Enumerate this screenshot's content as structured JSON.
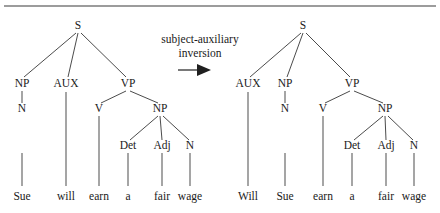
{
  "figure": {
    "background_color": "#ffffff",
    "ink_color": "#1a1a1a",
    "top_rule": {
      "x1": 4,
      "y1": 6,
      "x2": 436,
      "y2": 6
    }
  },
  "operation": {
    "line1": "subject-auxiliary",
    "line2": "inversion",
    "line1_pos": {
      "x": 200,
      "y": 43
    },
    "line2_pos": {
      "x": 200,
      "y": 57
    },
    "arrow": {
      "tail_x1": 178,
      "tail_x2": 197,
      "y": 70,
      "head_points": "197,64 211,70 197,76"
    }
  },
  "trees": [
    {
      "id": "tree-source",
      "name": "source-tree",
      "sentence": "Sue will earn a fair wage",
      "nodes": [
        {
          "id": "S",
          "label": "S",
          "x": 78,
          "y": 29
        },
        {
          "id": "NP1",
          "label": "NP",
          "x": 22,
          "y": 87
        },
        {
          "id": "AUX",
          "label": "AUX",
          "x": 66,
          "y": 87
        },
        {
          "id": "VP",
          "label": "VP",
          "x": 128,
          "y": 87
        },
        {
          "id": "N1",
          "label": "N",
          "x": 22,
          "y": 112
        },
        {
          "id": "V",
          "label": "V",
          "x": 99,
          "y": 112
        },
        {
          "id": "NP2",
          "label": "NP",
          "x": 160,
          "y": 112
        },
        {
          "id": "Det",
          "label": "Det",
          "x": 128,
          "y": 149
        },
        {
          "id": "Adj",
          "label": "Adj",
          "x": 162,
          "y": 149
        },
        {
          "id": "N2",
          "label": "N",
          "x": 190,
          "y": 149
        }
      ],
      "edges": [
        {
          "from": "S",
          "to": "NP1",
          "x1": 76,
          "y1": 33,
          "x2": 24,
          "y2": 77
        },
        {
          "from": "S",
          "to": "AUX",
          "x1": 78,
          "y1": 33,
          "x2": 68,
          "y2": 77
        },
        {
          "from": "S",
          "to": "VP",
          "x1": 81,
          "y1": 33,
          "x2": 126,
          "y2": 77
        },
        {
          "from": "NP1",
          "to": "N1",
          "x1": 22,
          "y1": 91,
          "x2": 22,
          "y2": 103
        },
        {
          "from": "VP",
          "to": "V",
          "x1": 126,
          "y1": 91,
          "x2": 101,
          "y2": 103
        },
        {
          "from": "VP",
          "to": "NP2",
          "x1": 130,
          "y1": 91,
          "x2": 158,
          "y2": 103
        },
        {
          "from": "NP2",
          "to": "Det",
          "x1": 158,
          "y1": 116,
          "x2": 130,
          "y2": 140
        },
        {
          "from": "NP2",
          "to": "Adj",
          "x1": 160,
          "y1": 116,
          "x2": 162,
          "y2": 140
        },
        {
          "from": "NP2",
          "to": "N2",
          "x1": 163,
          "y1": 116,
          "x2": 189,
          "y2": 140
        }
      ],
      "leaves": [
        {
          "label": "Sue",
          "x": 22,
          "y": 200,
          "stem_from": "N1",
          "stem_y1": 153,
          "stem_y2": 186
        },
        {
          "label": "will",
          "x": 66,
          "y": 200,
          "stem_from": "AUX",
          "stem_y1": 92,
          "stem_y2": 186
        },
        {
          "label": "earn",
          "x": 99,
          "y": 200,
          "stem_from": "V",
          "stem_y1": 116,
          "stem_y2": 186
        },
        {
          "label": "a",
          "x": 128,
          "y": 200,
          "stem_from": "Det",
          "stem_y1": 153,
          "stem_y2": 186
        },
        {
          "label": "fair",
          "x": 162,
          "y": 200,
          "stem_from": "Adj",
          "stem_y1": 153,
          "stem_y2": 186
        },
        {
          "label": "wage",
          "x": 190,
          "y": 200,
          "stem_from": "N2",
          "stem_y1": 153,
          "stem_y2": 186
        }
      ]
    },
    {
      "id": "tree-result",
      "name": "result-tree",
      "sentence": "Will Sue earn a fair wage",
      "nodes": [
        {
          "id": "S",
          "label": "S",
          "x": 303,
          "y": 29
        },
        {
          "id": "AUX",
          "label": "AUX",
          "x": 248,
          "y": 87
        },
        {
          "id": "NP1",
          "label": "NP",
          "x": 285,
          "y": 87
        },
        {
          "id": "VP",
          "label": "VP",
          "x": 352,
          "y": 87
        },
        {
          "id": "N1",
          "label": "N",
          "x": 285,
          "y": 112
        },
        {
          "id": "V",
          "label": "V",
          "x": 323,
          "y": 112
        },
        {
          "id": "NP2",
          "label": "NP",
          "x": 385,
          "y": 112
        },
        {
          "id": "Det",
          "label": "Det",
          "x": 352,
          "y": 149
        },
        {
          "id": "Adj",
          "label": "Adj",
          "x": 386,
          "y": 149
        },
        {
          "id": "N2",
          "label": "N",
          "x": 414,
          "y": 149
        }
      ],
      "edges": [
        {
          "from": "S",
          "to": "AUX",
          "x1": 301,
          "y1": 33,
          "x2": 250,
          "y2": 77
        },
        {
          "from": "S",
          "to": "NP1",
          "x1": 303,
          "y1": 33,
          "x2": 287,
          "y2": 77
        },
        {
          "from": "S",
          "to": "VP",
          "x1": 306,
          "y1": 33,
          "x2": 350,
          "y2": 77
        },
        {
          "from": "NP1",
          "to": "N1",
          "x1": 285,
          "y1": 91,
          "x2": 285,
          "y2": 103
        },
        {
          "from": "VP",
          "to": "V",
          "x1": 350,
          "y1": 91,
          "x2": 325,
          "y2": 103
        },
        {
          "from": "VP",
          "to": "NP2",
          "x1": 354,
          "y1": 91,
          "x2": 383,
          "y2": 103
        },
        {
          "from": "NP2",
          "to": "Det",
          "x1": 383,
          "y1": 116,
          "x2": 354,
          "y2": 140
        },
        {
          "from": "NP2",
          "to": "Adj",
          "x1": 385,
          "y1": 116,
          "x2": 386,
          "y2": 140
        },
        {
          "from": "NP2",
          "to": "N2",
          "x1": 388,
          "y1": 116,
          "x2": 413,
          "y2": 140
        }
      ],
      "leaves": [
        {
          "label": "Will",
          "x": 248,
          "y": 200,
          "stem_from": "AUX",
          "stem_y1": 92,
          "stem_y2": 186
        },
        {
          "label": "Sue",
          "x": 285,
          "y": 200,
          "stem_from": "N1",
          "stem_y1": 153,
          "stem_y2": 186
        },
        {
          "label": "earn",
          "x": 323,
          "y": 200,
          "stem_from": "V",
          "stem_y1": 116,
          "stem_y2": 186
        },
        {
          "label": "a",
          "x": 352,
          "y": 200,
          "stem_from": "Det",
          "stem_y1": 153,
          "stem_y2": 186
        },
        {
          "label": "fair",
          "x": 386,
          "y": 200,
          "stem_from": "Adj",
          "stem_y1": 153,
          "stem_y2": 186
        },
        {
          "label": "wage",
          "x": 414,
          "y": 200,
          "stem_from": "N2",
          "stem_y1": 153,
          "stem_y2": 186
        }
      ]
    }
  ]
}
